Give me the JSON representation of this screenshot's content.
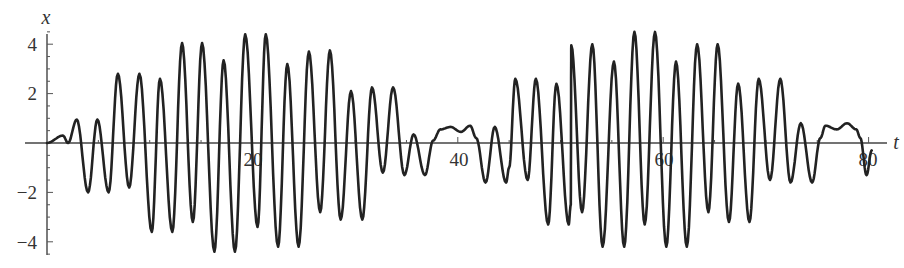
{
  "chart_data": {
    "type": "line",
    "title": "",
    "xlabel": "t",
    "ylabel": "x",
    "xlim": [
      0,
      82
    ],
    "ylim": [
      -4.5,
      4.6
    ],
    "grid": false,
    "legend": null,
    "x_ticks": [
      20,
      40,
      60,
      80
    ],
    "x_tick_labels": [
      "20",
      "40",
      "60",
      "80"
    ],
    "y_ticks": [
      -4,
      -2,
      2,
      4
    ],
    "y_tick_labels": [
      "−4",
      "−2",
      "2",
      "4"
    ],
    "series": [
      {
        "name": "x(t)",
        "color": "#222222",
        "description": "Beating oscillation: carrier period ~2, envelope repeating ~every 39 time units, max amplitude ~4.4",
        "extrema": [
          [
            0.0,
            0.0
          ],
          [
            1.55,
            0.3
          ],
          [
            2.05,
            0.0
          ],
          [
            2.9,
            0.95
          ],
          [
            4.0,
            -2.0
          ],
          [
            4.9,
            0.95
          ],
          [
            6.0,
            -2.0
          ],
          [
            6.9,
            2.8
          ],
          [
            8.0,
            -1.8
          ],
          [
            9.0,
            2.8
          ],
          [
            10.2,
            -3.6
          ],
          [
            11.0,
            2.6
          ],
          [
            12.2,
            -3.6
          ],
          [
            13.15,
            4.05
          ],
          [
            14.2,
            -3.2
          ],
          [
            15.1,
            4.05
          ],
          [
            16.3,
            -4.4
          ],
          [
            17.2,
            3.35
          ],
          [
            18.3,
            -4.4
          ],
          [
            19.3,
            4.4
          ],
          [
            20.5,
            -3.4
          ],
          [
            21.3,
            4.4
          ],
          [
            22.5,
            -4.2
          ],
          [
            23.4,
            3.2
          ],
          [
            24.5,
            -4.2
          ],
          [
            25.5,
            3.7
          ],
          [
            26.6,
            -2.8
          ],
          [
            27.55,
            3.75
          ],
          [
            28.6,
            -3.1
          ],
          [
            29.6,
            2.1
          ],
          [
            30.7,
            -3.1
          ],
          [
            31.65,
            2.25
          ],
          [
            32.7,
            -1.2
          ],
          [
            33.7,
            2.25
          ],
          [
            34.8,
            -1.3
          ],
          [
            35.7,
            0.35
          ],
          [
            36.8,
            -1.3
          ],
          [
            37.6,
            0.1
          ],
          [
            38.3,
            0.55
          ],
          [
            39.3,
            0.65
          ],
          [
            40.3,
            0.45
          ],
          [
            41.2,
            0.7
          ],
          [
            41.8,
            0.2
          ],
          [
            42.7,
            -1.6
          ],
          [
            43.6,
            0.65
          ],
          [
            44.7,
            -1.6
          ],
          [
            45.0,
            -1.0
          ],
          [
            45.0,
            -1.0
          ],
          [
            45.6,
            2.6
          ],
          [
            46.8,
            -1.5
          ],
          [
            47.6,
            2.6
          ],
          [
            48.8,
            -3.3
          ],
          [
            49.6,
            2.4
          ],
          [
            50.8,
            -3.3
          ],
          [
            51.0,
            -2.5
          ],
          [
            51.0,
            -2.5
          ],
          [
            51.05,
            3.95
          ],
          [
            52.1,
            -2.8
          ],
          [
            53.1,
            4.0
          ],
          [
            54.1,
            -4.2
          ],
          [
            55.2,
            3.3
          ],
          [
            56.2,
            -4.2
          ],
          [
            57.2,
            4.5
          ],
          [
            58.2,
            -3.3
          ],
          [
            59.2,
            4.5
          ],
          [
            60.3,
            -4.2
          ],
          [
            61.25,
            3.3
          ],
          [
            62.3,
            -4.2
          ],
          [
            63.3,
            4.0
          ],
          [
            64.4,
            -2.8
          ],
          [
            65.3,
            4.0
          ],
          [
            66.4,
            -3.2
          ],
          [
            67.3,
            2.4
          ],
          [
            68.4,
            -3.2
          ],
          [
            69.3,
            2.6
          ],
          [
            70.4,
            -1.5
          ],
          [
            71.4,
            2.6
          ],
          [
            72.4,
            -1.6
          ],
          [
            73.4,
            0.8
          ],
          [
            74.5,
            -1.6
          ],
          [
            75.3,
            0.2
          ],
          [
            75.8,
            0.7
          ],
          [
            76.9,
            0.55
          ],
          [
            77.9,
            0.8
          ],
          [
            78.8,
            0.55
          ],
          [
            79.2,
            0.2
          ],
          [
            79.8,
            -1.3
          ],
          [
            80.3,
            -0.3
          ]
        ]
      }
    ]
  },
  "layout": {
    "origin_px": [
      47,
      143
    ],
    "px_per_t": 10.27,
    "px_per_x": 24.7
  }
}
